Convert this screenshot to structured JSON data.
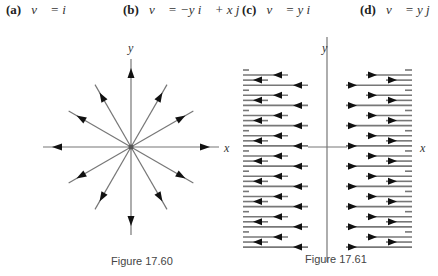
{
  "options": [
    {
      "label": "(a)",
      "equation": "v⃗ = i⃗"
    },
    {
      "label": "(b)",
      "equation": "v⃗ = −y i⃗ + x j⃗"
    },
    {
      "label": "(c)",
      "equation": "v⃗ = y i⃗"
    },
    {
      "label": "(d)",
      "equation": "v⃗ = y j⃗"
    }
  ],
  "figures": [
    {
      "caption": "Figure 17.60",
      "x_axis_label": "x",
      "y_axis_label": "y",
      "description": "Radial vector field: 12 arrows pointing outward from the origin at 30° intervals"
    },
    {
      "caption": "Figure 17.61",
      "x_axis_label": "x",
      "y_axis_label": "y",
      "description": "Horizontal vector field: arrows point left for x<0 and right for x>0, lengths repeating in a 4-row pattern"
    }
  ],
  "colors": {
    "line": "#777777",
    "arrow": "#111111",
    "text": "#222222"
  }
}
